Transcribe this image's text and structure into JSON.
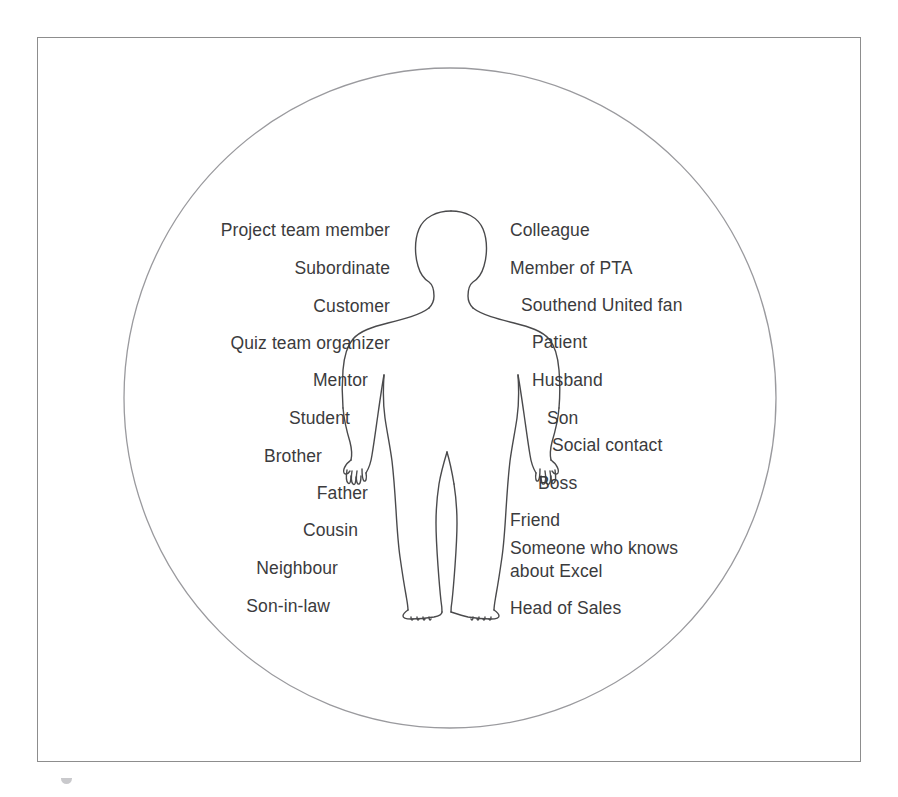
{
  "figure": {
    "frame_border_color": "#8d8d8d",
    "background_color": "#ffffff",
    "circle_stroke_color": "#9a9a9e",
    "body_stroke_color": "#4a4a4c",
    "text_color": "#3b3b3d",
    "circle_label": "identity-circle",
    "body_label": "human-body-silhouette"
  },
  "roles": {
    "left_column": [
      {
        "label": "Project team member",
        "top": 219,
        "indent": 0
      },
      {
        "label": "Subordinate",
        "top": 257,
        "indent": 0
      },
      {
        "label": "Customer",
        "top": 295,
        "indent": 0
      },
      {
        "top": 332,
        "label": "Quiz team organizer",
        "indent": 0
      },
      {
        "label": "Mentor",
        "top": 369,
        "indent": 22
      },
      {
        "label": "Student",
        "top": 407,
        "indent": 40
      },
      {
        "label": "Brother",
        "top": 445,
        "indent": 68
      },
      {
        "label": "Father",
        "top": 482,
        "indent": 22
      },
      {
        "label": "Cousin",
        "top": 519,
        "indent": 32
      },
      {
        "label": "Neighbour",
        "top": 557,
        "indent": 52
      },
      {
        "label": "Son-in-law",
        "top": 595,
        "indent": 60
      }
    ],
    "right_column": [
      {
        "label": "Colleague",
        "top": 219,
        "indent": 0
      },
      {
        "label": "Member of PTA",
        "top": 257,
        "indent": 0
      },
      {
        "label": "Southend United fan",
        "top": 294,
        "indent": 11
      },
      {
        "label": "Patient",
        "top": 331,
        "indent": 22
      },
      {
        "label": "Husband",
        "top": 369,
        "indent": 22
      },
      {
        "label": "Son",
        "top": 407,
        "indent": 37
      },
      {
        "label": "Social contact",
        "top": 434,
        "indent": 42
      },
      {
        "label": "Boss",
        "top": 472,
        "indent": 28
      },
      {
        "label": "Friend",
        "top": 509,
        "indent": 0
      },
      {
        "label": "Someone who knows",
        "top": 537,
        "indent": 0
      },
      {
        "label": "about Excel",
        "top": 560,
        "indent": 0
      },
      {
        "label": "Head of Sales",
        "top": 597,
        "indent": 0
      }
    ]
  },
  "caption": {
    "text": "Figure",
    "visible_fragment": ""
  }
}
